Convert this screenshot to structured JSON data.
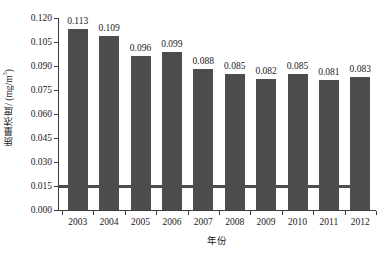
{
  "chart_data": {
    "type": "bar",
    "title": "",
    "xlabel": "年份",
    "ylabel": "质量浓度/ (mg/m",
    "ylabel_sup": "3",
    "ylabel_tail": ")",
    "categories": [
      "2003",
      "2004",
      "2005",
      "2006",
      "2007",
      "2008",
      "2009",
      "2010",
      "2011",
      "2012"
    ],
    "values": [
      0.113,
      0.109,
      0.096,
      0.099,
      0.088,
      0.085,
      0.082,
      0.085,
      0.081,
      0.083
    ],
    "value_labels": [
      "0.113",
      "0.109",
      "0.096",
      "0.099",
      "0.088",
      "0.085",
      "0.082",
      "0.085",
      "0.081",
      "0.083"
    ],
    "ylim": [
      0.0,
      0.12
    ],
    "ytick_values": [
      0.0,
      0.015,
      0.03,
      0.045,
      0.06,
      0.075,
      0.09,
      0.105,
      0.12
    ],
    "ytick_labels": [
      "0.000",
      "0.015",
      "0.030",
      "0.045",
      "0.060",
      "0.075",
      "0.090",
      "0.105",
      "0.120"
    ],
    "grid": false,
    "legend": null,
    "annotations": [
      {
        "name": "reference-line",
        "type": "hline",
        "value": 0.015,
        "color": "#4d4d4d"
      }
    ],
    "series_color": "#4d4d4d",
    "axis_color": "#3c3c3c",
    "background_color": "#ffffff"
  }
}
